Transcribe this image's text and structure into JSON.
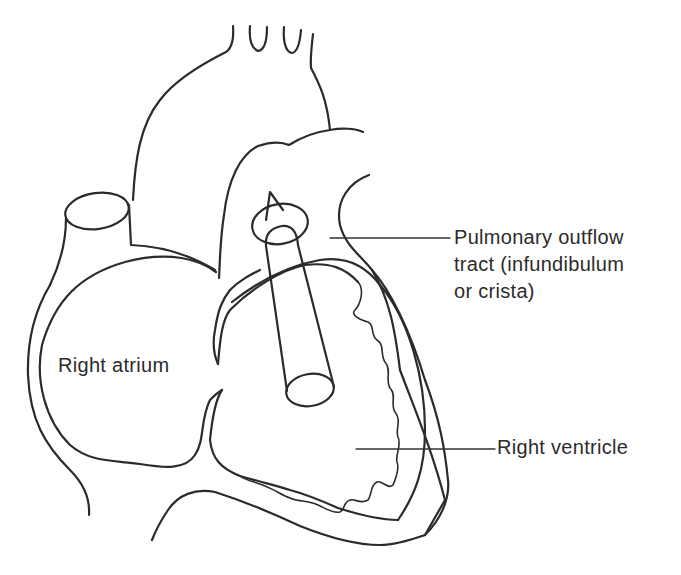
{
  "figure": {
    "type": "anatomical line diagram",
    "line_color": "#2b2b2b",
    "background": "#ffffff"
  },
  "labels": {
    "pulmonary_outflow": {
      "line1": "Pulmonary outflow",
      "line2": "tract (infundibulum",
      "line3": "or crista)"
    },
    "right_atrium": "Right atrium",
    "right_ventricle": "Right ventricle"
  },
  "leaders": [
    {
      "target": "pulmonary_outflow",
      "from": [
        330,
        238
      ],
      "to": [
        450,
        238
      ]
    },
    {
      "target": "right_ventricle",
      "from": [
        356,
        449
      ],
      "to": [
        495,
        449
      ]
    }
  ]
}
